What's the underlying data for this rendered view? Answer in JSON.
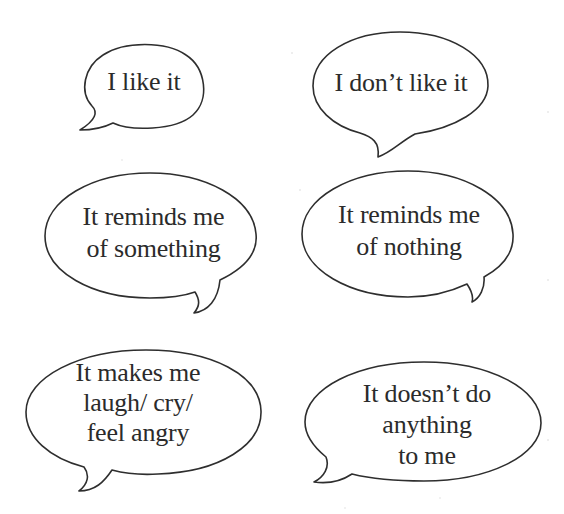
{
  "bubbles": [
    {
      "id": "like",
      "lines": [
        "I like it"
      ]
    },
    {
      "id": "dislike",
      "lines": [
        "I don’t like it"
      ]
    },
    {
      "id": "reminds-something",
      "lines": [
        "It reminds me",
        "of  something"
      ]
    },
    {
      "id": "reminds-nothing",
      "lines": [
        "It reminds me",
        "of  nothing"
      ]
    },
    {
      "id": "makes-me-feel",
      "lines": [
        "It makes me",
        "laugh/  cry/",
        "feel angry"
      ]
    },
    {
      "id": "does-nothing",
      "lines": [
        "It doesn’t do",
        "anything",
        "to me"
      ]
    }
  ],
  "colors": {
    "background": "#ffffff",
    "outline": "#2e2e2e",
    "text": "#2b2b2b"
  }
}
